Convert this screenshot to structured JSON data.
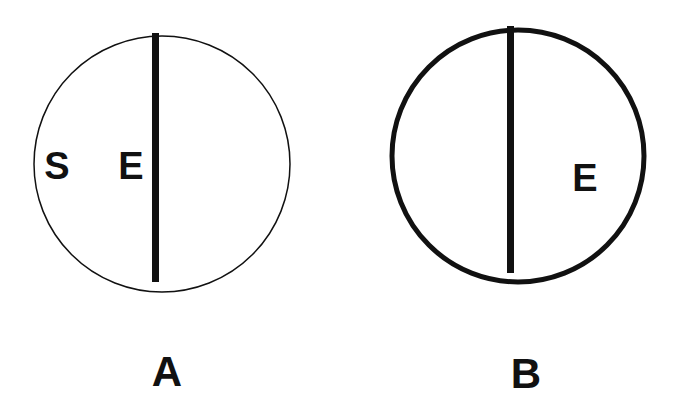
{
  "diagram": {
    "type": "two-panel comparison",
    "ink_color": "#111111",
    "background": "#ffffff",
    "panels": [
      {
        "id": "A",
        "label": "A",
        "circle_outline": "thin",
        "divider": "vertical bar slightly left of center",
        "letters_left": [
          "S",
          "E"
        ],
        "letters_right": []
      },
      {
        "id": "B",
        "label": "B",
        "circle_outline": "thick",
        "divider": "vertical bar near center",
        "letters_left": [],
        "letters_right": [
          "E"
        ]
      }
    ]
  }
}
